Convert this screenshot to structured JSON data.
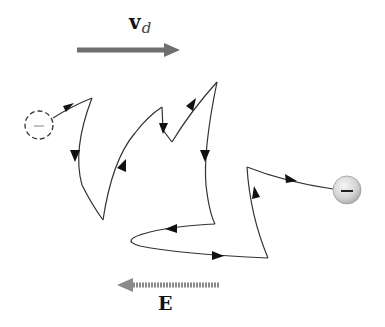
{
  "diagram": {
    "drift_velocity_label": {
      "symbol": "v",
      "subscript": "d"
    },
    "field_label": "E",
    "initial_charge_sign": "–",
    "final_charge_sign": "–",
    "colors": {
      "drift_arrow": "#6f6f6f",
      "field_arrow": "#8a8a8a",
      "path": "#333333",
      "ball_fill": "#d9d9d9",
      "ball_edge": "#9a9a9a"
    },
    "drift_arrow": {
      "x1": 77,
      "y1": 50,
      "x2": 177,
      "y2": 50,
      "direction": "right"
    },
    "field_arrow": {
      "x1": 219,
      "y1": 285,
      "x2": 119,
      "y2": 285,
      "direction": "left"
    },
    "initial_position": {
      "cx": 39,
      "cy": 125,
      "r": 14,
      "style": "dashed"
    },
    "final_position": {
      "cx": 347,
      "cy": 190,
      "r": 14,
      "style": "solid-shaded"
    },
    "path_points": [
      [
        53,
        120
      ],
      [
        92,
        98
      ],
      [
        103,
        220
      ],
      [
        162,
        107
      ],
      [
        172,
        142
      ],
      [
        217,
        82
      ],
      [
        215,
        224
      ],
      [
        134,
        242
      ],
      [
        268,
        258
      ],
      [
        247,
        167
      ],
      [
        333,
        189
      ]
    ]
  }
}
